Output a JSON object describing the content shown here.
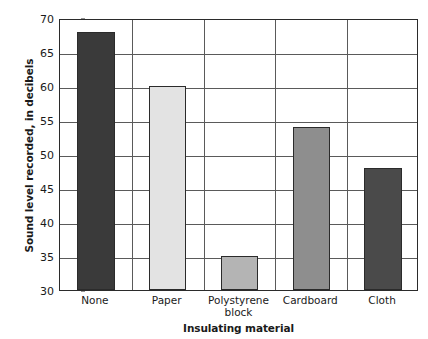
{
  "title_remnant": "",
  "axes": {
    "y_title": "Sound level recorded, in decibels",
    "x_title": "Insulating material"
  },
  "chart_data": {
    "type": "bar",
    "title": "",
    "xlabel": "Insulating material",
    "ylabel": "Sound level recorded, in decibels",
    "categories": [
      "None",
      "Paper",
      "Polystyrene block",
      "Cardboard",
      "Cloth"
    ],
    "values": [
      68,
      60,
      35,
      54,
      48
    ],
    "bar_colors": [
      "#3a3a3a",
      "#e3e3e3",
      "#b4b4b4",
      "#8e8e8e",
      "#4a4a4a"
    ],
    "bar_edge_color": "#2b2b2b",
    "ylim": [
      30,
      70
    ],
    "yticks": [
      30,
      35,
      40,
      45,
      50,
      55,
      60,
      65,
      70
    ],
    "ytick_labels": [
      "30",
      "35",
      "40",
      "45",
      "50",
      "55",
      "60",
      "65",
      "70"
    ],
    "grid": true,
    "grid_axis": "both",
    "grid_color": "#5a5a5a",
    "legend": false,
    "background": "#ffffff"
  }
}
